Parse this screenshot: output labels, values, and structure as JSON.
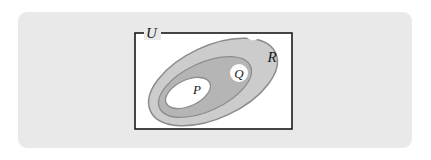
{
  "figure": {
    "background_color": "#ffffff",
    "card_color": "#e9e9e9",
    "universe": {
      "label": "U",
      "shape": "rectangle",
      "fill": "#ffffff",
      "stroke": "#1a1a1a",
      "x": 135,
      "y": 33,
      "width": 157,
      "height": 96
    },
    "sets": [
      {
        "name": "R",
        "label": "R",
        "role": "outer-set",
        "fill": "#cccccc",
        "stroke": "#8c8c8c",
        "cx": 213,
        "cy": 82,
        "rx": 69,
        "ry": 36,
        "rotation": -25,
        "label_x": 272,
        "label_y": 57,
        "label_badge": false
      },
      {
        "name": "Q",
        "label": "Q",
        "role": "middle-set",
        "fill": "#b5b5b5",
        "stroke": "#8c8c8c",
        "cx": 205,
        "cy": 87,
        "rx": 50,
        "ry": 24,
        "rotation": -25,
        "label_x": 239,
        "label_y": 73,
        "label_badge": true
      },
      {
        "name": "P",
        "label": "P",
        "role": "inner-set",
        "fill": "#ffffff",
        "stroke": "#8c8c8c",
        "cx": 188,
        "cy": 93,
        "rx": 24,
        "ry": 13,
        "rotation": -25,
        "label_x": 197,
        "label_y": 89,
        "label_badge": true
      }
    ],
    "labels": {
      "universe": "U",
      "outer_set": "R",
      "middle_set": "Q",
      "inner_set": "P"
    },
    "colors": {
      "card": "#e9e9e9",
      "page": "#ffffff",
      "outer_fill": "#cccccc",
      "middle_fill": "#b5b5b5",
      "inner_fill": "#ffffff",
      "ellipse_stroke": "#8c8c8c",
      "rect_stroke": "#1a1a1a",
      "text": "#1a1a1a"
    }
  }
}
